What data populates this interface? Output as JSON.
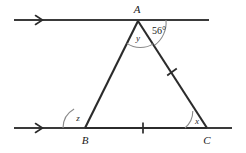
{
  "figure": {
    "background_color": "#ffffff",
    "stroke_color": "#2b2b2b",
    "arc_color": "#8a8a8a",
    "vertices": {
      "A": {
        "label": "A",
        "x": 138,
        "y": 21,
        "label_x": 137,
        "label_y": 13
      },
      "B": {
        "label": "B",
        "x": 85,
        "y": 128,
        "label_x": 85,
        "label_y": 142
      },
      "C": {
        "label": "C",
        "x": 207,
        "y": 128,
        "label_x": 207,
        "label_y": 142
      }
    },
    "angles": [
      {
        "name": "y",
        "label": "y",
        "at": "A",
        "label_x": 138,
        "label_y": 40,
        "interior": true
      },
      {
        "name": "x",
        "label": "x",
        "at": "C",
        "label_x": 197,
        "label_y": 121,
        "interior": true
      },
      {
        "name": "z",
        "label": "z",
        "at": "B",
        "label_x": 78,
        "label_y": 119,
        "interior": false
      },
      {
        "name": "angle_56",
        "label": "56°",
        "at": "A",
        "label_x": 159,
        "label_y": 31,
        "interior": false
      }
    ],
    "parallel_lines": [
      {
        "name": "top-line",
        "y": 20,
        "x1": 14,
        "x2": 209,
        "arrow_x": 41,
        "arrow_count": 1
      },
      {
        "name": "bottom-line",
        "y": 128,
        "x1": 14,
        "x2": 232,
        "arrow_x": 41,
        "arrow_count": 1
      }
    ],
    "tick_marks": [
      {
        "name": "tick-side-AC",
        "x": 172,
        "y": 72
      },
      {
        "name": "tick-side-BC",
        "x": 143,
        "y": 128
      }
    ],
    "segments": [
      {
        "name": "segment-AB",
        "from": "A",
        "to": "B"
      },
      {
        "name": "segment-AC",
        "from": "A",
        "to": "C"
      },
      {
        "name": "segment-BC",
        "from": "B",
        "to": "C"
      }
    ]
  }
}
